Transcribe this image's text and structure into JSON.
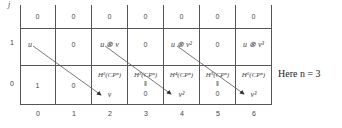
{
  "axes": {
    "y_label": "j",
    "x_labels": [
      "0",
      "1",
      "2",
      "3",
      "4",
      "5",
      "6"
    ],
    "y_labels": [
      "1",
      "0"
    ]
  },
  "rows": {
    "top": [
      "0",
      "0",
      "0",
      "0",
      "0",
      "0",
      "0"
    ],
    "row1": [
      "u",
      "0",
      "u ⊗ v",
      "0",
      "u ⊗ v²",
      "0",
      "u ⊗ v³"
    ],
    "row0": [
      {
        "text": "1"
      },
      {
        "text": "0"
      },
      {
        "group": "H²(CPⁿ)",
        "value": "v"
      },
      {
        "group": "H³(CPⁿ)",
        "mark": "‖",
        "value": "0"
      },
      {
        "group": "H⁴(CPⁿ)",
        "value": "v²"
      },
      {
        "group": "H⁵(CPⁿ)",
        "mark": "‖",
        "value": "0"
      },
      {
        "group": "H⁶(CPⁿ)",
        "value": "v³"
      }
    ]
  },
  "arrows": [
    {
      "from": "u",
      "to": "v"
    },
    {
      "from": "u ⊗ v",
      "to": "v²"
    },
    {
      "from": "u ⊗ v²",
      "to": "v³"
    }
  ],
  "note": "Here n = 3"
}
